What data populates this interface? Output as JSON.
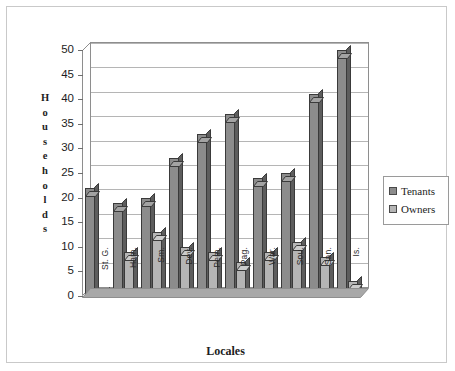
{
  "chart_data": {
    "type": "bar",
    "title": "",
    "xlabel": "Locales",
    "ylabel": "Households",
    "categories": [
      "St. G.",
      "Ham.",
      "Sm.",
      "Dev.",
      "Pem.",
      "Pag.",
      "War.",
      "Sou.",
      "San.",
      "Is."
    ],
    "series": [
      {
        "name": "Tenants",
        "color": "#8c8c8c",
        "values": [
          22,
          19,
          20,
          28,
          33,
          37,
          24,
          25,
          41,
          50
        ]
      },
      {
        "name": "Owners",
        "color": "#b5b5b5",
        "values": [
          0,
          9,
          13,
          10,
          9,
          7,
          9,
          11,
          8,
          3
        ]
      }
    ],
    "ylim": [
      0,
      50
    ],
    "yticks": [
      50,
      45,
      40,
      35,
      30,
      25,
      20,
      15,
      10,
      5,
      0
    ],
    "grid": true,
    "legend_position": "right"
  },
  "axis": {
    "y_title_letters": [
      "H",
      "o",
      "u",
      "s",
      "e",
      "h",
      "o",
      "l",
      "d",
      "s"
    ],
    "y_title": "Households",
    "x_title": "Locales"
  },
  "legend": {
    "entries": [
      {
        "label": "Tenants",
        "color": "#8c8c8c"
      },
      {
        "label": "Owners",
        "color": "#b5b5b5"
      }
    ]
  }
}
